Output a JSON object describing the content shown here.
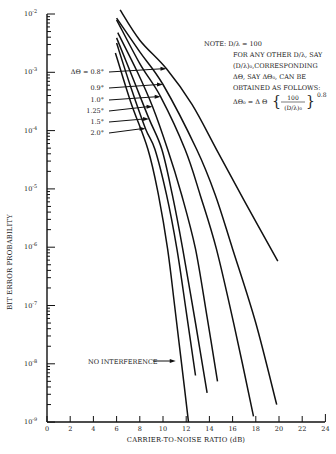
{
  "chart_data": {
    "type": "line",
    "title": "",
    "xlabel": "CARRIER-TO-NOISE RATIO (dB)",
    "ylabel": "BIT ERROR PROBABILITY",
    "xlim": [
      0,
      24
    ],
    "ylim": [
      1e-09,
      0.01
    ],
    "yscale": "log",
    "grid": false,
    "x_ticks": [
      "0",
      "2",
      "4",
      "6",
      "8",
      "10",
      "12",
      "14",
      "16",
      "18",
      "20",
      "22",
      "24"
    ],
    "y_ticks": [
      {
        "base": "10",
        "exp": "-2"
      },
      {
        "base": "10",
        "exp": "-3"
      },
      {
        "base": "10",
        "exp": "-4"
      },
      {
        "base": "10",
        "exp": "-5"
      },
      {
        "base": "10",
        "exp": "-6"
      },
      {
        "base": "10",
        "exp": "-7"
      },
      {
        "base": "10",
        "exp": "-8"
      },
      {
        "base": "10",
        "exp": "-9"
      }
    ],
    "series": [
      {
        "name": "ΔΘ = 0.8°",
        "label": "ΔΘ = 0.8°",
        "points": [
          [
            6.3,
            -1.93
          ],
          [
            8.0,
            -2.45
          ],
          [
            10.3,
            -2.94
          ],
          [
            12.5,
            -3.55
          ],
          [
            14.6,
            -4.32
          ],
          [
            17.0,
            -5.2
          ],
          [
            19.9,
            -6.24
          ]
        ]
      },
      {
        "name": "0.9°",
        "label": "0.9°",
        "points": [
          [
            6.0,
            -2.07
          ],
          [
            8.0,
            -2.65
          ],
          [
            10.0,
            -3.21
          ],
          [
            12.9,
            -4.32
          ],
          [
            14.5,
            -5.1
          ],
          [
            16.0,
            -6.03
          ],
          [
            18.0,
            -7.3
          ],
          [
            19.8,
            -8.7
          ]
        ]
      },
      {
        "name": "1.0°",
        "label": "1.0°",
        "points": [
          [
            6.0,
            -2.1
          ],
          [
            8.0,
            -2.85
          ],
          [
            9.8,
            -3.42
          ],
          [
            11.9,
            -4.32
          ],
          [
            13.2,
            -5.1
          ],
          [
            14.6,
            -6.03
          ],
          [
            16.2,
            -7.4
          ],
          [
            17.8,
            -8.9
          ]
        ]
      },
      {
        "name": "1.25°",
        "label": "1.25°",
        "points": [
          [
            6.1,
            -2.32
          ],
          [
            7.8,
            -3.0
          ],
          [
            9.1,
            -3.59
          ],
          [
            10.4,
            -4.32
          ],
          [
            11.6,
            -5.1
          ],
          [
            12.8,
            -6.03
          ],
          [
            13.8,
            -7.2
          ],
          [
            14.7,
            -8.3
          ]
        ]
      },
      {
        "name": "1.5°",
        "label": "1.5°",
        "points": [
          [
            6.0,
            -2.41
          ],
          [
            7.5,
            -3.15
          ],
          [
            8.8,
            -3.8
          ],
          [
            9.9,
            -4.32
          ],
          [
            10.8,
            -5.1
          ],
          [
            11.7,
            -6.03
          ],
          [
            12.8,
            -7.3
          ],
          [
            13.8,
            -8.5
          ]
        ]
      },
      {
        "name": "2.0°",
        "label": "2.0°",
        "points": [
          [
            6.0,
            -2.5
          ],
          [
            7.3,
            -3.3
          ],
          [
            8.5,
            -3.97
          ],
          [
            9.3,
            -4.32
          ],
          [
            10.3,
            -5.1
          ],
          [
            11.2,
            -6.03
          ],
          [
            12.0,
            -7.1
          ],
          [
            12.8,
            -8.2
          ]
        ]
      },
      {
        "name": "NO INTERFERENCE",
        "label": "NO INTERFERENCE",
        "points": [
          [
            5.9,
            -2.67
          ],
          [
            7.2,
            -3.5
          ],
          [
            8.7,
            -4.32
          ],
          [
            9.6,
            -5.1
          ],
          [
            10.4,
            -6.03
          ],
          [
            11.0,
            -7.0
          ],
          [
            11.6,
            -8.0
          ],
          [
            12.2,
            -9.0
          ]
        ]
      }
    ],
    "annotations": {
      "delta_labels": [
        {
          "text": "ΔΘ = 0.8°",
          "target_x": 10.3,
          "target_logy": -2.94
        },
        {
          "text": "0.9°",
          "target_x": 10.0,
          "target_logy": -3.21
        },
        {
          "text": "1.0°",
          "target_x": 9.8,
          "target_logy": -3.42
        },
        {
          "text": "1.25°",
          "target_x": 9.1,
          "target_logy": -3.59
        },
        {
          "text": "1.5°",
          "target_x": 8.8,
          "target_logy": -3.8
        },
        {
          "text": "2.0°",
          "target_x": 8.5,
          "target_logy": -3.97
        }
      ],
      "no_interference": {
        "text": "NO INTERFERENCE",
        "target_x": 11.1,
        "target_logy": -7.2
      },
      "note": {
        "lines": [
          "NOTE:  D/λ = 100",
          "FOR ANY OTHER D/λ, SAY",
          "(D/λ)₀,CORRESPONDING",
          "ΔΘ, SAY ΔΘ₀, CAN BE",
          "OBTAINED AS FOLLOWS:"
        ],
        "formula_lhs": "ΔΘ₀ = Δ Θ",
        "formula_num": "100",
        "formula_den": "(D/λ)₀",
        "formula_exp": "0.8"
      }
    }
  }
}
